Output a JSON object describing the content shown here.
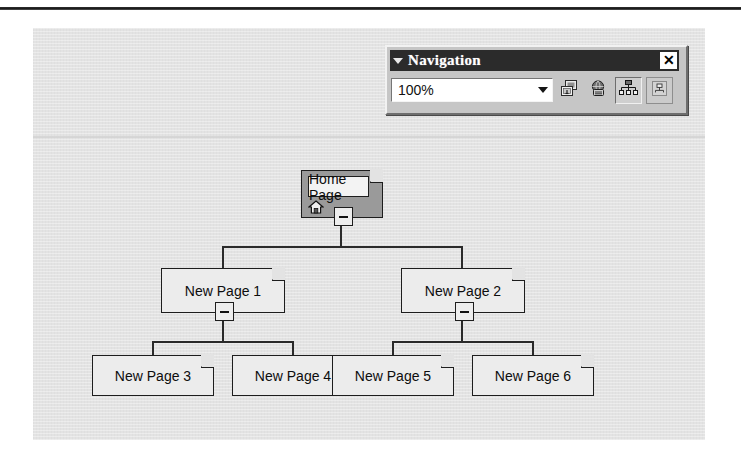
{
  "window": {
    "background_color": "#ffffff",
    "canvas_color": "#e3e3e3"
  },
  "toolbar": {
    "title": "Navigation",
    "grip_icon": "triangle-down-icon",
    "close_label": "✕",
    "zoom": {
      "value": "100%",
      "placeholder": "Zoom",
      "options": [
        "25%",
        "50%",
        "75%",
        "100%",
        "150%",
        "200%",
        "Size To Fit"
      ],
      "dropdown_icon": "chevron-down-icon"
    },
    "buttons": [
      {
        "name": "add-existing-page-button",
        "icon": "add-page-icon",
        "tooltip": "Add Existing Page",
        "state": "normal"
      },
      {
        "name": "external-link-button",
        "icon": "globe-link-icon",
        "tooltip": "External Link",
        "state": "normal"
      },
      {
        "name": "portrait-landscape-button",
        "icon": "site-tree-icon",
        "tooltip": "Portrait/Landscape",
        "state": "pressed"
      },
      {
        "name": "view-subtree-only-button",
        "icon": "subtree-icon",
        "tooltip": "View Subtree Only",
        "state": "sunk"
      }
    ]
  },
  "tree": {
    "accent_color": "#2a2a2a",
    "node_fill": "#ececec",
    "home_fill": "#9a9a9a",
    "nodes": [
      {
        "id": "home",
        "label": "Home Page",
        "icon": "home-icon",
        "collapse": "minus-box",
        "level": 0
      },
      {
        "id": "page1",
        "label": "New Page 1",
        "icon": "",
        "collapse": "minus-box",
        "level": 1
      },
      {
        "id": "page2",
        "label": "New Page 2",
        "icon": "",
        "collapse": "minus-box",
        "level": 1
      },
      {
        "id": "page3",
        "label": "New Page 3",
        "icon": "",
        "collapse": "",
        "level": 2
      },
      {
        "id": "page4",
        "label": "New Page 4",
        "icon": "",
        "collapse": "",
        "level": 2
      },
      {
        "id": "page5",
        "label": "New Page 5",
        "icon": "",
        "collapse": "",
        "level": 2
      },
      {
        "id": "page6",
        "label": "New Page 6",
        "icon": "",
        "collapse": "",
        "level": 2
      }
    ]
  }
}
